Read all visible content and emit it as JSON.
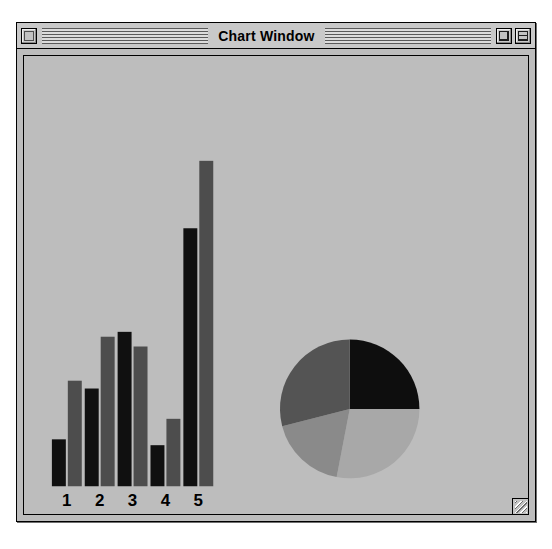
{
  "window": {
    "title": "Chart Window",
    "close_box": "close-box",
    "zoom_box": "zoom-box",
    "collapse_box": "collapse-box",
    "grow_box": "grow-box",
    "background_color": "#bdbdbd",
    "frame_color": "#000000"
  },
  "chart_data": [
    {
      "type": "bar",
      "title": "",
      "xlabel": "",
      "ylabel": "",
      "categories": [
        "1",
        "2",
        "3",
        "4",
        "5"
      ],
      "tick_labels": [
        "1",
        "2",
        "3",
        "4",
        "5"
      ],
      "grid": false,
      "legend": "none",
      "ylim": [
        0,
        350
      ],
      "series": [
        {
          "name": "Series A",
          "color": "#101010",
          "values": [
            48,
            100,
            158,
            42,
            264
          ]
        },
        {
          "name": "Series B",
          "color": "#4d4d4d",
          "values": [
            108,
            153,
            143,
            69,
            333
          ]
        }
      ]
    },
    {
      "type": "pie",
      "title": "",
      "legend": "none",
      "center": [
        350,
        411
      ],
      "radius": 70,
      "start_angle_deg": -90,
      "slices": [
        {
          "label": "Slice 1",
          "value": 25,
          "color": "#0e0e0e"
        },
        {
          "label": "Slice 2",
          "value": 28,
          "color": "#a8a8a8"
        },
        {
          "label": "Slice 3",
          "value": 18,
          "color": "#8a8a8a"
        },
        {
          "label": "Slice 4",
          "value": 29,
          "color": "#545454"
        }
      ]
    }
  ]
}
